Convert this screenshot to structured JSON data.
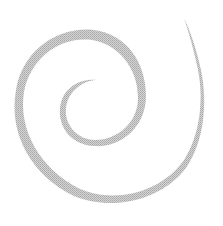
{
  "image": {
    "subject": "spiral",
    "colors": {
      "background": "#ffffff",
      "spiral": "#b8b8b8"
    }
  }
}
